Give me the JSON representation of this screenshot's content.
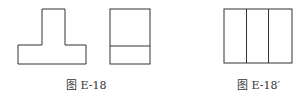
{
  "figures": [
    {
      "caption": "图 E-18",
      "views": [
        "t-shaped-front-view",
        "side-view-rectangle-with-horizontal-line"
      ]
    },
    {
      "caption": "图 E-18′",
      "views": [
        "rectangle-with-two-vertical-lines"
      ]
    }
  ],
  "stroke_color": "#333333"
}
